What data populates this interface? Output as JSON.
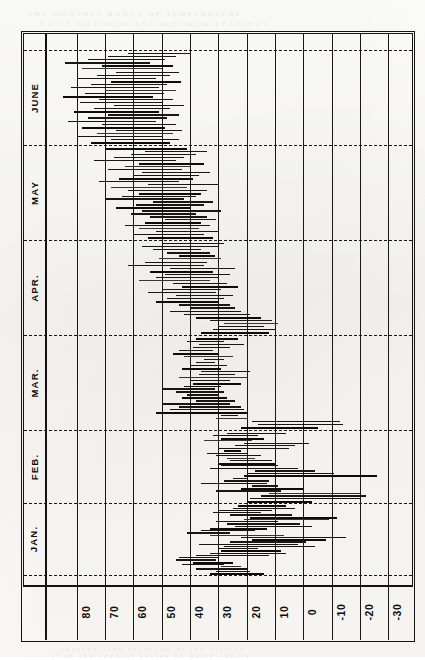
{
  "figure": {
    "orientation": "rotated-90",
    "frame_color": "#15130f",
    "paper_color": "#fbfaf7"
  },
  "ghost_text": [
    {
      "t": "THE MONTHLY RANGE OF TEMPERATURE",
      "x": 28,
      "y": 10
    },
    {
      "t": "DAILY MAXIMUM AND MINIMUM READINGS",
      "x": 40,
      "y": 20
    },
    {
      "t": "observations recorded at the station",
      "x": 60,
      "y": 645
    },
    {
      "t": "from the regular series of daily charts",
      "x": 52,
      "y": 652
    }
  ],
  "months": {
    "label_axis": "Month",
    "items": [
      {
        "name": "JAN.",
        "start": 503,
        "end": 575
      },
      {
        "name": "FEB.",
        "start": 430,
        "end": 503
      },
      {
        "name": "MAR.",
        "start": 335,
        "end": 430
      },
      {
        "name": "APR.",
        "start": 240,
        "end": 335
      },
      {
        "name": "MAY",
        "start": 145,
        "end": 240
      },
      {
        "name": "JUNE",
        "start": 50,
        "end": 145
      }
    ],
    "boundaries": [
      50,
      145,
      240,
      335,
      430,
      503,
      575
    ]
  },
  "chart_data": {
    "type": "bar",
    "subtype": "horizontal-range-bars",
    "title": "",
    "xlabel": "",
    "ylabel": "",
    "orientation": "horizontal",
    "value_axis": {
      "name": "Temperature (degrees F)",
      "ticks": [
        80,
        70,
        60,
        50,
        40,
        30,
        20,
        10,
        0,
        -10,
        -20,
        -30
      ],
      "tick_labels": [
        "80",
        "70",
        "60",
        "50",
        "40",
        "30",
        "20",
        "10",
        "0",
        "-10",
        "-20",
        "-30"
      ],
      "direction": "descending-left-to-right",
      "range": [
        85,
        -35
      ],
      "grid": true
    },
    "category_axis": {
      "name": "Date",
      "groups": [
        "JAN.",
        "FEB.",
        "MAR.",
        "APR.",
        "MAY",
        "JUNE"
      ],
      "direction": "bottom-to-top",
      "grid": "dashed-month-boundaries"
    },
    "legend": {
      "show": false,
      "entries": []
    },
    "series": [
      {
        "name": "Daily temperature range (max to min)",
        "note": "each bar spans the day's minimum to maximum temperature",
        "groups": [
          {
            "month": "JAN.",
            "bars": [
              {
                "hi": 33,
                "lo": 14
              },
              {
                "hi": 31,
                "lo": 19
              },
              {
                "hi": 38,
                "lo": 20
              },
              {
                "hi": 29,
                "lo": 22
              },
              {
                "hi": 43,
                "lo": 28
              },
              {
                "hi": 39,
                "lo": 25
              },
              {
                "hi": 45,
                "lo": 31
              },
              {
                "hi": 44,
                "lo": 30
              },
              {
                "hi": 38,
                "lo": 12
              },
              {
                "hi": 33,
                "lo": 6
              },
              {
                "hi": 29,
                "lo": 8
              },
              {
                "hi": 30,
                "lo": 16
              },
              {
                "hi": 28,
                "lo": -4
              },
              {
                "hi": 37,
                "lo": 2
              },
              {
                "hi": 26,
                "lo": -1
              },
              {
                "hi": 18,
                "lo": -8
              },
              {
                "hi": 22,
                "lo": -15
              },
              {
                "hi": 33,
                "lo": 7
              },
              {
                "hi": 41,
                "lo": 26
              },
              {
                "hi": 36,
                "lo": 17
              },
              {
                "hi": 33,
                "lo": 13
              },
              {
                "hi": 24,
                "lo": -3
              },
              {
                "hi": 27,
                "lo": 1
              },
              {
                "hi": 31,
                "lo": 9
              },
              {
                "hi": 21,
                "lo": -9
              },
              {
                "hi": 19,
                "lo": -12
              },
              {
                "hi": 26,
                "lo": 4
              },
              {
                "hi": 32,
                "lo": 15
              },
              {
                "hi": 30,
                "lo": 11
              },
              {
                "hi": 25,
                "lo": 3
              },
              {
                "hi": 23,
                "lo": 6
              }
            ]
          },
          {
            "month": "FEB.",
            "bars": [
              {
                "hi": 20,
                "lo": -3
              },
              {
                "hi": 19,
                "lo": -20
              },
              {
                "hi": 15,
                "lo": -22
              },
              {
                "hi": 12,
                "lo": -20
              },
              {
                "hi": 31,
                "lo": 8
              },
              {
                "hi": 22,
                "lo": 0
              },
              {
                "hi": 18,
                "lo": 9
              },
              {
                "hi": 36,
                "lo": 13
              },
              {
                "hi": 28,
                "lo": 12
              },
              {
                "hi": 25,
                "lo": 20
              },
              {
                "hi": 21,
                "lo": -26
              },
              {
                "hi": 20,
                "lo": -11
              },
              {
                "hi": 17,
                "lo": -4
              },
              {
                "hi": 33,
                "lo": 2
              },
              {
                "hi": 29,
                "lo": 9
              },
              {
                "hi": 30,
                "lo": 10
              },
              {
                "hi": 26,
                "lo": 11
              },
              {
                "hi": 27,
                "lo": 17
              },
              {
                "hi": 31,
                "lo": 15
              },
              {
                "hi": 34,
                "lo": 20
              },
              {
                "hi": 28,
                "lo": 22
              },
              {
                "hi": 30,
                "lo": 5
              },
              {
                "hi": 24,
                "lo": 3
              },
              {
                "hi": 21,
                "lo": -2
              },
              {
                "hi": 35,
                "lo": 18
              },
              {
                "hi": 29,
                "lo": 14
              },
              {
                "hi": 32,
                "lo": 16
              },
              {
                "hi": 27,
                "lo": 6
              }
            ]
          },
          {
            "month": "MAR.",
            "bars": [
              {
                "hi": 22,
                "lo": -5
              },
              {
                "hi": 16,
                "lo": -14
              },
              {
                "hi": 18,
                "lo": -13
              },
              {
                "hi": 31,
                "lo": 20
              },
              {
                "hi": 29,
                "lo": 23
              },
              {
                "hi": 52,
                "lo": 20
              },
              {
                "hi": 47,
                "lo": 21
              },
              {
                "hi": 44,
                "lo": 22
              },
              {
                "hi": 50,
                "lo": 26
              },
              {
                "hi": 38,
                "lo": 24
              },
              {
                "hi": 43,
                "lo": 27
              },
              {
                "hi": 41,
                "lo": 30
              },
              {
                "hi": 45,
                "lo": 28
              },
              {
                "hi": 50,
                "lo": 31
              },
              {
                "hi": 42,
                "lo": 29
              },
              {
                "hi": 39,
                "lo": 22
              },
              {
                "hi": 40,
                "lo": 26
              },
              {
                "hi": 44,
                "lo": 20
              },
              {
                "hi": 37,
                "lo": 24
              },
              {
                "hi": 36,
                "lo": 19
              },
              {
                "hi": 43,
                "lo": 29
              },
              {
                "hi": 40,
                "lo": 27
              },
              {
                "hi": 38,
                "lo": 31
              },
              {
                "hi": 35,
                "lo": 28
              },
              {
                "hi": 42,
                "lo": 25
              },
              {
                "hi": 46,
                "lo": 30
              },
              {
                "hi": 44,
                "lo": 32
              },
              {
                "hi": 39,
                "lo": 26
              },
              {
                "hi": 37,
                "lo": 21
              },
              {
                "hi": 41,
                "lo": 28
              },
              {
                "hi": 38,
                "lo": 23
              }
            ]
          },
          {
            "month": "APR.",
            "bars": [
              {
                "hi": 36,
                "lo": 12
              },
              {
                "hi": 32,
                "lo": 10
              },
              {
                "hi": 30,
                "lo": 14
              },
              {
                "hi": 28,
                "lo": 9
              },
              {
                "hi": 33,
                "lo": 11
              },
              {
                "hi": 38,
                "lo": 15
              },
              {
                "hi": 42,
                "lo": 19
              },
              {
                "hi": 47,
                "lo": 22
              },
              {
                "hi": 40,
                "lo": 24
              },
              {
                "hi": 44,
                "lo": 26
              },
              {
                "hi": 52,
                "lo": 30
              },
              {
                "hi": 48,
                "lo": 28
              },
              {
                "hi": 45,
                "lo": 25
              },
              {
                "hi": 55,
                "lo": 31
              },
              {
                "hi": 50,
                "lo": 29
              },
              {
                "hi": 43,
                "lo": 23
              },
              {
                "hi": 46,
                "lo": 27
              },
              {
                "hi": 58,
                "lo": 33
              },
              {
                "hi": 52,
                "lo": 30
              },
              {
                "hi": 49,
                "lo": 26
              },
              {
                "hi": 54,
                "lo": 32
              },
              {
                "hi": 47,
                "lo": 24
              },
              {
                "hi": 62,
                "lo": 35
              },
              {
                "hi": 56,
                "lo": 34
              },
              {
                "hi": 51,
                "lo": 29
              },
              {
                "hi": 44,
                "lo": 31
              },
              {
                "hi": 48,
                "lo": 33
              },
              {
                "hi": 53,
                "lo": 36
              },
              {
                "hi": 57,
                "lo": 30
              },
              {
                "hi": 50,
                "lo": 28
              }
            ]
          },
          {
            "month": "MAY",
            "bars": [
              {
                "hi": 55,
                "lo": 32
              },
              {
                "hi": 60,
                "lo": 35
              },
              {
                "hi": 52,
                "lo": 30
              },
              {
                "hi": 58,
                "lo": 37
              },
              {
                "hi": 63,
                "lo": 33
              },
              {
                "hi": 56,
                "lo": 36
              },
              {
                "hi": 49,
                "lo": 31
              },
              {
                "hi": 54,
                "lo": 34
              },
              {
                "hi": 61,
                "lo": 38
              },
              {
                "hi": 57,
                "lo": 29
              },
              {
                "hi": 66,
                "lo": 40
              },
              {
                "hi": 59,
                "lo": 35
              },
              {
                "hi": 53,
                "lo": 32
              },
              {
                "hi": 70,
                "lo": 42
              },
              {
                "hi": 64,
                "lo": 38
              },
              {
                "hi": 58,
                "lo": 36
              },
              {
                "hi": 62,
                "lo": 34
              },
              {
                "hi": 68,
                "lo": 41
              },
              {
                "hi": 55,
                "lo": 30
              },
              {
                "hi": 72,
                "lo": 44
              },
              {
                "hi": 65,
                "lo": 39
              },
              {
                "hi": 60,
                "lo": 37
              },
              {
                "hi": 57,
                "lo": 33
              },
              {
                "hi": 69,
                "lo": 43
              },
              {
                "hi": 63,
                "lo": 40
              },
              {
                "hi": 58,
                "lo": 35
              },
              {
                "hi": 74,
                "lo": 45
              },
              {
                "hi": 67,
                "lo": 42
              },
              {
                "hi": 61,
                "lo": 38
              },
              {
                "hi": 56,
                "lo": 34
              },
              {
                "hi": 70,
                "lo": 41
              }
            ]
          },
          {
            "month": "JUNE",
            "bars": [
              {
                "hi": 75,
                "lo": 47
              },
              {
                "hi": 68,
                "lo": 44
              },
              {
                "hi": 80,
                "lo": 50
              },
              {
                "hi": 73,
                "lo": 46
              },
              {
                "hi": 66,
                "lo": 43
              },
              {
                "hi": 78,
                "lo": 49
              },
              {
                "hi": 71,
                "lo": 45
              },
              {
                "hi": 83,
                "lo": 52
              },
              {
                "hi": 76,
                "lo": 48
              },
              {
                "hi": 69,
                "lo": 44
              },
              {
                "hi": 81,
                "lo": 51
              },
              {
                "hi": 74,
                "lo": 47
              },
              {
                "hi": 67,
                "lo": 42
              },
              {
                "hi": 79,
                "lo": 50
              },
              {
                "hi": 72,
                "lo": 46
              },
              {
                "hi": 85,
                "lo": 53
              },
              {
                "hi": 77,
                "lo": 49
              },
              {
                "hi": 70,
                "lo": 45
              },
              {
                "hi": 82,
                "lo": 51
              },
              {
                "hi": 75,
                "lo": 48
              },
              {
                "hi": 68,
                "lo": 43
              },
              {
                "hi": 80,
                "lo": 52
              },
              {
                "hi": 73,
                "lo": 47
              },
              {
                "hi": 66,
                "lo": 44
              },
              {
                "hi": 78,
                "lo": 50
              },
              {
                "hi": 71,
                "lo": 46
              },
              {
                "hi": 84,
                "lo": 54
              },
              {
                "hi": 76,
                "lo": 49
              },
              {
                "hi": 69,
                "lo": 45
              },
              {
                "hi": 62,
                "lo": 40
              }
            ]
          }
        ]
      }
    ]
  },
  "geometry": {
    "plot_left": 23,
    "plot_right": 413,
    "plot_top": 33,
    "plot_bottom": 585,
    "month_col_right": 45,
    "data_left": 47,
    "axis_strip_top": 585,
    "axis_strip_bottom": 640,
    "tick_x": [
      76.7,
      105.0,
      133.3,
      161.7,
      190.0,
      218.3,
      246.7,
      275.0,
      303.3,
      331.7,
      360.0,
      388.3
    ],
    "px_per_degree": 2.833,
    "value_at_x0": 107.0
  }
}
